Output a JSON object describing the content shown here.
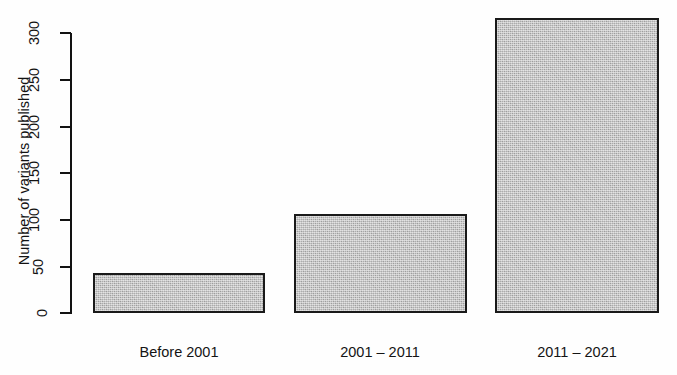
{
  "chart_data": {
    "type": "bar",
    "title": "",
    "xlabel": "",
    "ylabel": "Number of variants published",
    "categories": [
      "Before 2001",
      "2001 – 2011",
      "2011 – 2021"
    ],
    "values": [
      43,
      106,
      316
    ],
    "ylim": [
      0,
      300
    ],
    "yticks": [
      0,
      50,
      100,
      150,
      200,
      250,
      300
    ],
    "ytick_labels": [
      "0",
      "50",
      "100",
      "150",
      "200",
      "250",
      "300"
    ],
    "grid": false,
    "legend": false,
    "legend_position": "none",
    "bar_fill_color": "#b6b6b6",
    "bar_border_color": "#1a1a1a",
    "background_color": "#fefefe",
    "axis_color": "#121212",
    "note": "Third bar extends above the 300 axis maximum"
  },
  "axis": {
    "ticks": [
      {
        "label": "300",
        "value": 300
      },
      {
        "label": "250",
        "value": 250
      },
      {
        "label": "200",
        "value": 200
      },
      {
        "label": "150",
        "value": 150
      },
      {
        "label": "100",
        "value": 100
      },
      {
        "label": "50",
        "value": 50
      },
      {
        "label": "0",
        "value": 0
      }
    ],
    "title": "Number of variants published"
  },
  "bars": [
    {
      "label": "Before 2001",
      "value": 43
    },
    {
      "label": "2001 – 2011",
      "value": 106
    },
    {
      "label": "2011 – 2021",
      "value": 316
    }
  ]
}
